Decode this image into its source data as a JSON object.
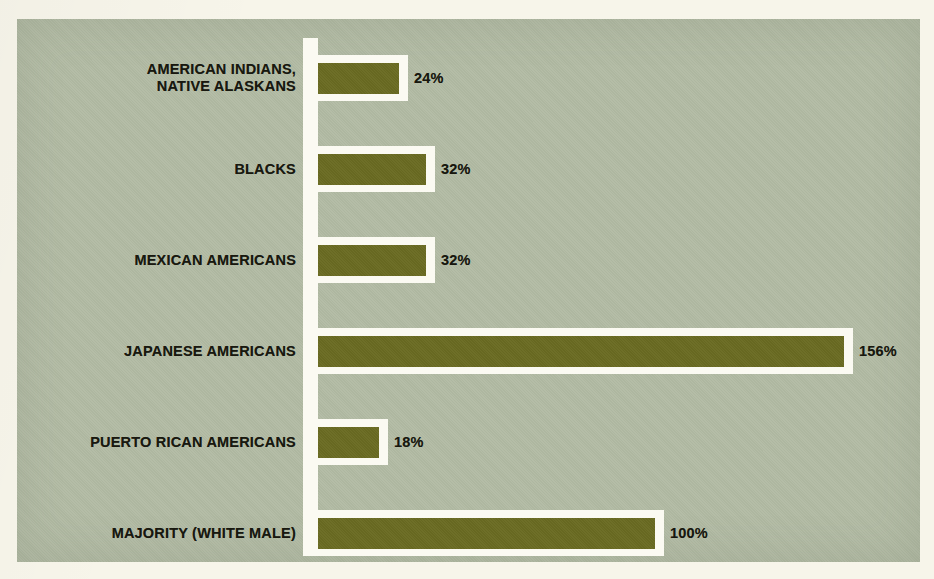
{
  "figure": {
    "panel_color": "#b2bba4",
    "bar_color": "#6a6b22",
    "outline_color": "#fbfaf2",
    "page_color": "#f7f5ea",
    "axis_color": "#fbfaf2",
    "text_color": "#17170e"
  },
  "chart_data": {
    "type": "bar",
    "orientation": "horizontal",
    "title": "",
    "subtitle": "",
    "xlabel": "",
    "ylabel": "",
    "grid": false,
    "legend": null,
    "unit": "%",
    "xlim": [
      0,
      156
    ],
    "baseline": 0,
    "categories": [
      "AMERICAN INDIANS,\nNATIVE ALASKANS",
      "BLACKS",
      "MEXICAN AMERICANS",
      "JAPANESE AMERICANS",
      "PUERTO RICAN AMERICANS",
      "MAJORITY (WHITE MALE)"
    ],
    "values": [
      24,
      32,
      32,
      156,
      18,
      100
    ],
    "value_labels": [
      "24%",
      "32%",
      "32%",
      "156%",
      "18%",
      "100%"
    ],
    "bars": [
      {
        "category": "AMERICAN INDIANS,\nNATIVE ALASKANS",
        "value": 24,
        "label": "24%"
      },
      {
        "category": "BLACKS",
        "value": 32,
        "label": "32%"
      },
      {
        "category": "MEXICAN AMERICANS",
        "value": 32,
        "label": "32%"
      },
      {
        "category": "JAPANESE AMERICANS",
        "value": 156,
        "label": "156%"
      },
      {
        "category": "PUERTO RICAN AMERICANS",
        "value": 18,
        "label": "18%"
      },
      {
        "category": "MAJORITY (WHITE MALE)",
        "value": 100,
        "label": "100%"
      }
    ]
  },
  "layout": {
    "px_per_percent": 3.37,
    "row_tops": [
      36,
      127,
      218,
      309,
      400,
      491
    ],
    "row_height": 46
  }
}
